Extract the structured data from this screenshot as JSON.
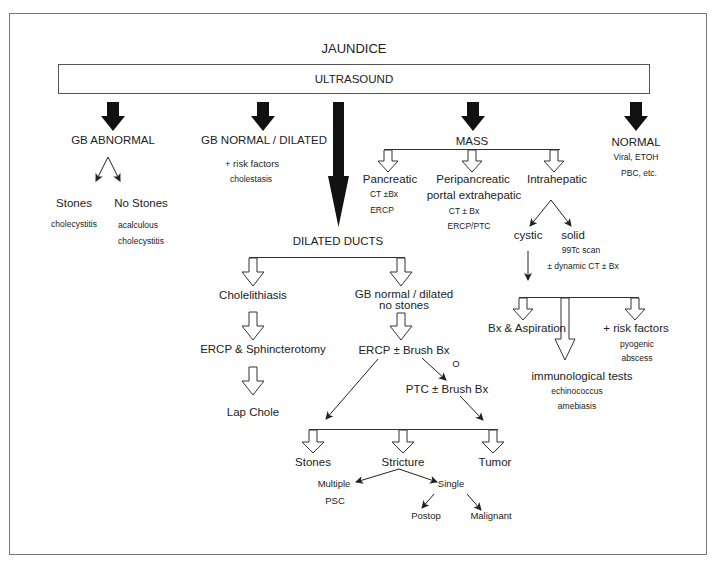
{
  "diagram": {
    "title": "JAUNDICE",
    "root_box": "ULTRASOUND",
    "branches": {
      "gb_abnormal": {
        "label": "GB ABNORMAL",
        "children": [
          {
            "label": "Stones",
            "note": "cholecystitis"
          },
          {
            "label": "No Stones",
            "note_line1": "acalculous",
            "note_line2": "cholecystitis"
          }
        ]
      },
      "gb_normal": {
        "label": "GB NORMAL / DILATED",
        "sub": "+ risk factors",
        "note": "cholestasis"
      },
      "dilated_ducts": {
        "label": "DILATED DUCTS",
        "left": {
          "label": "Cholelithiasis",
          "step1": "ERCP & Sphincterotomy",
          "step2": "Lap Chole"
        },
        "right": {
          "label_line1": "GB normal / dilated",
          "label_line2": "no stones",
          "step1": "ERCP ± Brush Bx",
          "or": "O",
          "step2": "PTC ± Brush Bx",
          "outcomes": [
            {
              "label": "Stones"
            },
            {
              "label": "Stricture"
            },
            {
              "label": "Tumor"
            }
          ],
          "stricture": {
            "multiple": "Multiple",
            "multiple_note": "PSC",
            "single": "Single",
            "single_children": [
              "Postop",
              "Malignant"
            ]
          }
        }
      },
      "mass": {
        "label": "MASS",
        "pancreatic": {
          "label": "Pancreatic",
          "line1": "CT ±Bx",
          "line2": "ERCP"
        },
        "peripancreatic": {
          "label": "Peripancreatic",
          "label2": "portal extrahepatic",
          "line1": "CT ± Bx",
          "line2": "ERCP/PTC"
        },
        "intrahepatic": {
          "label": "Intrahepatic",
          "cystic": "cystic",
          "solid": "solid",
          "solid_line1": "99Tc scan",
          "solid_line2": "± dynamic CT ± Bx",
          "cystic_children": {
            "bx": "Bx & Aspiration",
            "immuno": "immunological tests",
            "immuno_line1": "echinococcus",
            "immuno_line2": "amebiasis",
            "risk": "+ risk factors",
            "risk_line1": "pyogenic",
            "risk_line2": "abscess"
          }
        }
      },
      "normal": {
        "label": "NORMAL",
        "line1": "Viral, ETOH",
        "line2": "PBC, etc."
      }
    }
  },
  "colors": {
    "line": "#333333",
    "fill": "#111111",
    "border": "#777777"
  }
}
